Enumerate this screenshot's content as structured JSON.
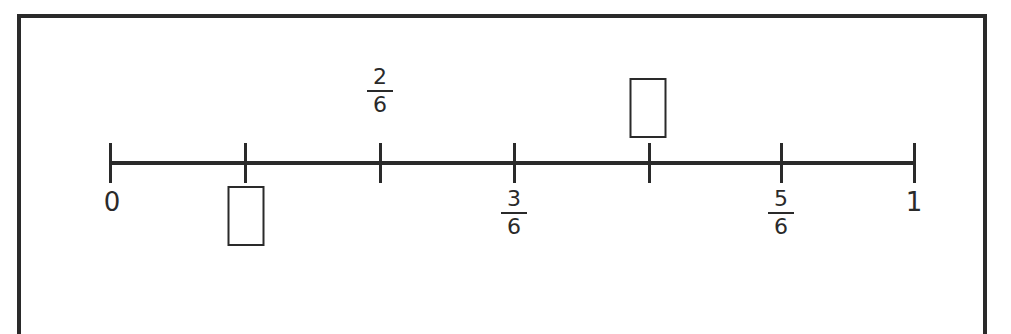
{
  "diagram": {
    "type": "number-line",
    "start": "0",
    "end": "1",
    "denominator": 6,
    "colors": {
      "ink": "#2a2a2a",
      "background": "#ffffff"
    },
    "ticks": [
      {
        "index": 0,
        "x": 110,
        "label_type": "whole",
        "label": "0",
        "position": "below"
      },
      {
        "index": 1,
        "x": 245,
        "label_type": "blank-box",
        "position": "below"
      },
      {
        "index": 2,
        "x": 380,
        "label_type": "fraction",
        "numerator": "2",
        "denominator": "6",
        "position": "above"
      },
      {
        "index": 3,
        "x": 514,
        "label_type": "fraction",
        "numerator": "3",
        "denominator": "6",
        "position": "below"
      },
      {
        "index": 4,
        "x": 649,
        "label_type": "blank-box",
        "position": "above"
      },
      {
        "index": 5,
        "x": 781,
        "label_type": "fraction",
        "numerator": "5",
        "denominator": "6",
        "position": "below"
      },
      {
        "index": 6,
        "x": 914,
        "label_type": "whole",
        "label": "1",
        "position": "below"
      }
    ]
  }
}
